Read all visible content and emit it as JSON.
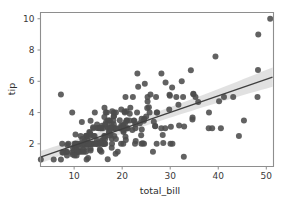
{
  "figure": {
    "background_color": "#ffffff",
    "width": 285,
    "height": 202
  },
  "axes": {
    "spine_color": "#8e8e8e",
    "xlabel": "total_bill",
    "ylabel": "tip",
    "x_ticks": [
      "10",
      "20",
      "30",
      "40",
      "50"
    ],
    "y_ticks": [
      "2",
      "4",
      "6",
      "8",
      "10"
    ]
  },
  "chart_data": {
    "type": "scatter",
    "title": "",
    "xlabel": "total_bill",
    "ylabel": "tip",
    "xlim": [
      3.0,
      51.5
    ],
    "ylim": [
      0.55,
      10.4
    ],
    "x_ticks": [
      10,
      20,
      30,
      40,
      50
    ],
    "y_ticks": [
      2,
      4,
      6,
      8,
      10
    ],
    "grid": false,
    "legend": null,
    "marker_color": "#4c4c4c",
    "marker_size": 3.0,
    "regression": {
      "type": "linear",
      "line_color": "#3f3f3f",
      "line_width": 1.3,
      "ci_band_color": "#c9c9c9",
      "ci_band_opacity": 0.55,
      "slope": 0.105,
      "intercept": 0.92,
      "x_start": 3.0,
      "x_end": 51.3,
      "y_start": 1.15,
      "y_end": 6.27,
      "ci_half_width_start": 0.22,
      "ci_half_width_end": 0.62
    },
    "x": [
      16.99,
      10.34,
      21.01,
      23.68,
      24.59,
      25.29,
      8.77,
      26.88,
      15.04,
      14.78,
      10.27,
      35.26,
      15.42,
      18.43,
      14.83,
      21.58,
      10.33,
      16.29,
      16.97,
      20.65,
      17.92,
      20.29,
      15.77,
      39.42,
      19.82,
      17.81,
      13.37,
      12.69,
      21.7,
      19.65,
      9.55,
      18.35,
      15.06,
      20.69,
      17.78,
      24.06,
      16.31,
      16.93,
      18.69,
      31.27,
      16.04,
      17.46,
      13.94,
      9.68,
      30.4,
      18.29,
      22.23,
      32.4,
      28.55,
      18.04,
      12.54,
      10.29,
      34.81,
      9.94,
      25.56,
      19.49,
      38.01,
      26.41,
      11.24,
      48.27,
      20.29,
      13.81,
      11.02,
      18.29,
      17.59,
      20.08,
      16.45,
      3.07,
      20.23,
      15.01,
      12.02,
      17.07,
      26.86,
      25.28,
      14.73,
      10.51,
      17.92,
      27.2,
      22.76,
      17.29,
      19.44,
      16.66,
      10.07,
      32.68,
      15.98,
      34.83,
      13.03,
      18.28,
      24.71,
      21.16,
      28.97,
      22.49,
      5.75,
      16.32,
      22.75,
      40.17,
      27.28,
      12.03,
      21.01,
      12.46,
      11.35,
      15.38,
      44.3,
      22.42,
      20.92,
      15.36,
      20.49,
      25.21,
      18.24,
      14.31,
      14.0,
      7.25,
      38.07,
      23.95,
      25.71,
      17.31,
      29.93,
      10.65,
      12.43,
      24.08,
      11.69,
      13.42,
      14.26,
      15.95,
      12.48,
      29.8,
      8.52,
      14.52,
      11.38,
      22.82,
      19.08,
      20.27,
      11.17,
      12.26,
      18.26,
      8.51,
      10.33,
      14.15,
      16.0,
      13.16,
      17.47,
      34.3,
      41.19,
      27.05,
      16.43,
      8.35,
      18.64,
      11.87,
      9.78,
      7.51,
      14.07,
      13.13,
      17.26,
      24.55,
      19.77,
      29.85,
      48.17,
      25.0,
      13.39,
      16.49,
      21.5,
      12.66,
      16.21,
      13.81,
      17.51,
      24.52,
      20.76,
      31.71,
      10.59,
      10.63,
      50.81,
      15.81,
      7.25,
      31.85,
      16.82,
      32.9,
      17.89,
      14.48,
      9.6,
      34.63,
      34.65,
      23.33,
      45.35,
      23.17,
      40.55,
      20.69,
      20.9,
      30.46,
      18.15,
      23.1,
      15.69,
      19.81,
      28.44,
      15.48,
      16.58,
      7.56,
      10.34,
      43.11,
      13.0,
      13.51,
      18.71,
      12.74,
      13.0,
      16.4,
      20.53,
      16.47,
      26.59,
      38.73,
      24.27,
      12.76,
      30.06,
      25.89,
      48.33,
      13.27,
      28.17,
      12.9,
      28.15,
      11.59,
      7.74,
      30.14,
      12.16,
      13.42,
      8.58,
      15.98,
      13.42,
      16.27,
      10.09,
      20.45,
      13.28,
      22.12,
      24.01,
      15.69,
      11.61,
      10.77,
      15.53,
      10.07,
      12.6,
      32.83,
      35.83,
      29.03,
      27.18,
      22.67,
      17.82,
      18.78
    ],
    "y": [
      1.01,
      1.66,
      3.5,
      3.31,
      3.61,
      4.71,
      2.0,
      3.12,
      1.96,
      3.23,
      1.71,
      5.0,
      1.57,
      3.0,
      3.02,
      3.92,
      1.67,
      3.71,
      3.5,
      3.35,
      4.08,
      2.75,
      2.23,
      7.58,
      3.18,
      2.34,
      2.0,
      2.0,
      4.3,
      3.0,
      1.45,
      2.5,
      3.0,
      2.45,
      3.27,
      3.6,
      2.0,
      3.07,
      2.31,
      5.0,
      2.24,
      2.54,
      3.06,
      1.32,
      5.6,
      3.0,
      5.0,
      6.0,
      2.05,
      3.0,
      2.5,
      2.6,
      5.2,
      1.56,
      4.34,
      3.51,
      3.0,
      1.5,
      1.76,
      6.73,
      3.21,
      2.0,
      1.98,
      3.76,
      2.64,
      3.15,
      2.47,
      1.0,
      2.01,
      2.09,
      1.97,
      3.0,
      3.14,
      5.0,
      2.2,
      1.25,
      3.08,
      4.0,
      3.0,
      2.71,
      3.0,
      3.4,
      1.83,
      5.0,
      2.03,
      5.17,
      2.0,
      4.0,
      5.85,
      3.0,
      3.0,
      3.5,
      1.0,
      4.3,
      3.25,
      4.73,
      4.0,
      1.5,
      3.0,
      1.5,
      2.5,
      3.0,
      2.5,
      3.48,
      4.08,
      1.64,
      4.06,
      4.29,
      3.76,
      4.0,
      3.0,
      1.0,
      4.0,
      2.55,
      4.0,
      3.5,
      5.07,
      1.5,
      1.8,
      2.92,
      2.31,
      1.68,
      2.5,
      2.0,
      2.52,
      4.2,
      1.48,
      2.0,
      2.0,
      2.18,
      1.5,
      2.83,
      1.5,
      2.0,
      3.25,
      1.25,
      2.0,
      2.0,
      2.0,
      2.75,
      3.5,
      6.7,
      5.0,
      5.0,
      2.3,
      1.5,
      1.36,
      1.63,
      1.73,
      2.0,
      2.5,
      2.0,
      2.74,
      2.0,
      2.0,
      5.14,
      5.0,
      3.75,
      2.61,
      2.0,
      3.5,
      2.5,
      2.0,
      2.0,
      3.0,
      3.48,
      2.24,
      4.5,
      1.61,
      2.0,
      10.0,
      3.16,
      5.15,
      3.18,
      4.0,
      3.11,
      2.0,
      2.0,
      4.0,
      3.55,
      3.68,
      5.65,
      3.5,
      6.5,
      3.0,
      5.0,
      3.5,
      2.0,
      3.5,
      4.0,
      1.5,
      4.19,
      2.56,
      2.02,
      4.0,
      1.44,
      2.0,
      5.0,
      2.0,
      2.0,
      4.0,
      2.0,
      2.0,
      2.5,
      4.0,
      3.23,
      3.41,
      3.0,
      2.03,
      2.23,
      2.0,
      5.16,
      9.0,
      2.5,
      6.5,
      1.1,
      3.0,
      1.5,
      1.44,
      3.09,
      2.2,
      3.48,
      1.92,
      3.0,
      1.58,
      2.5,
      2.0,
      3.0,
      2.72,
      2.88,
      2.0,
      3.0,
      3.39,
      1.47,
      3.0,
      1.25,
      1.0,
      1.17,
      4.67,
      5.92,
      2.0,
      2.0,
      1.75,
      3.0
    ]
  }
}
